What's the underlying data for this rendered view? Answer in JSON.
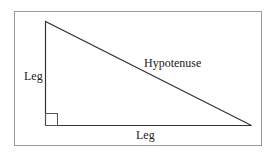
{
  "diagram": {
    "labels": {
      "vertical_leg": "Leg",
      "horizontal_leg": "Leg",
      "hypotenuse": "Hypotenuse"
    },
    "colors": {
      "frame": "#9a9a9a",
      "stroke": "#333333",
      "background": "#ffffff"
    }
  }
}
